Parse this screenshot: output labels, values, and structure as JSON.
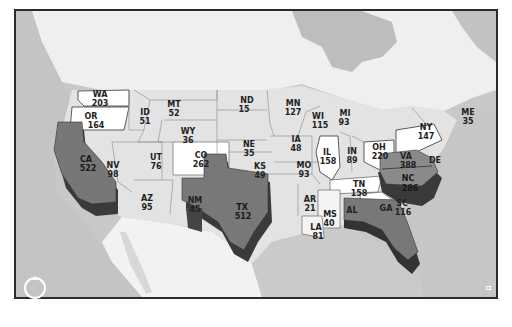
{
  "map": {
    "country_label": "MEXICO",
    "colors": {
      "frame": "#2b2b2b",
      "water": "#c8c8c8",
      "land_north": "#efefef",
      "state_default": "#e3e3e3",
      "state_high": "#ffffff",
      "extruded_top": "#777777",
      "extruded_side": "#3a3a3a"
    },
    "states": [
      {
        "abbr": "WA",
        "value": "203"
      },
      {
        "abbr": "OR",
        "value": "164"
      },
      {
        "abbr": "CA",
        "value": "522"
      },
      {
        "abbr": "NV",
        "value": "98"
      },
      {
        "abbr": "ID",
        "value": "51"
      },
      {
        "abbr": "MT",
        "value": "52"
      },
      {
        "abbr": "WY",
        "value": "36"
      },
      {
        "abbr": "UT",
        "value": "76"
      },
      {
        "abbr": "CO",
        "value": "262"
      },
      {
        "abbr": "AZ",
        "value": "95"
      },
      {
        "abbr": "NM",
        "value": "45"
      },
      {
        "abbr": "ND",
        "value": "15"
      },
      {
        "abbr": "NE",
        "value": "35"
      },
      {
        "abbr": "KS",
        "value": "49"
      },
      {
        "abbr": "TX",
        "value": "512"
      },
      {
        "abbr": "MN",
        "value": "127"
      },
      {
        "abbr": "IA",
        "value": "48"
      },
      {
        "abbr": "MO",
        "value": "93"
      },
      {
        "abbr": "AR",
        "value": "21"
      },
      {
        "abbr": "LA",
        "value": "81"
      },
      {
        "abbr": "WI",
        "value": "115"
      },
      {
        "abbr": "IL",
        "value": "158"
      },
      {
        "abbr": "MS",
        "value": "40"
      },
      {
        "abbr": "MI",
        "value": "93"
      },
      {
        "abbr": "IN",
        "value": "89"
      },
      {
        "abbr": "TN",
        "value": "158"
      },
      {
        "abbr": "AL",
        "value": ""
      },
      {
        "abbr": "OH",
        "value": "220"
      },
      {
        "abbr": "GA",
        "value": ""
      },
      {
        "abbr": "SC",
        "value": "116"
      },
      {
        "abbr": "VA",
        "value": "388"
      },
      {
        "abbr": "NC",
        "value": "286"
      },
      {
        "abbr": "NY",
        "value": "147"
      },
      {
        "abbr": "DE",
        "value": ""
      },
      {
        "abbr": "ME",
        "value": "35"
      }
    ]
  },
  "controls": {
    "compass": "compass-reset",
    "corner": "attribution-toggle"
  }
}
